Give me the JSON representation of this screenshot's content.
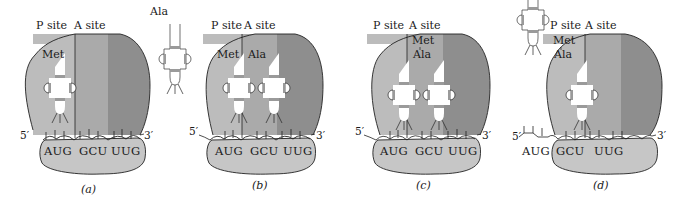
{
  "figure": {
    "colors": {
      "p_site": "#bcbcbc",
      "a_site": "#aaaaaa",
      "e_region": "#8e8e8e",
      "small_subunit": "#c6c6c6",
      "outline": "#222222",
      "trna_fill": "#ffffff",
      "trna_band": "#9a9a9a"
    },
    "panels": [
      {
        "id": "a",
        "caption": "(a)",
        "site_labels": {
          "p": "P site",
          "a": "A site"
        },
        "trna_in_p": "Met",
        "incoming_trna": "Ala",
        "codons": [
          "AUG",
          "GCU",
          "UUG"
        ],
        "five_prime": "5′",
        "three_prime": "3′"
      },
      {
        "id": "b",
        "caption": "(b)",
        "site_labels": {
          "p": "P site",
          "a": "A site"
        },
        "trna_in_p": "Met",
        "trna_in_a": "Ala",
        "codons": [
          "AUG",
          "GCU",
          "UUG"
        ],
        "five_prime": "5′",
        "three_prime": "3′"
      },
      {
        "id": "c",
        "caption": "(c)",
        "site_labels": {
          "p": "P site",
          "a": "A site"
        },
        "peptide_top": "Met",
        "peptide_bottom": "Ala",
        "codons": [
          "AUG",
          "GCU",
          "UUG"
        ],
        "five_prime": "5′",
        "three_prime": "3′"
      },
      {
        "id": "d",
        "caption": "(d)",
        "site_labels": {
          "p": "P site",
          "a": "A site"
        },
        "peptide_top": "Met",
        "peptide_bottom": "Ala",
        "codons": [
          "AUG",
          "GCU",
          "UUG"
        ],
        "five_prime": "5′",
        "three_prime": "3′"
      }
    ]
  }
}
